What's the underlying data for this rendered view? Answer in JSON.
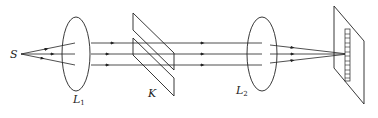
{
  "diagram": {
    "title": "",
    "labels": {
      "source": "S",
      "lens1": "L",
      "lens1_sub": "1",
      "wedge": "K",
      "lens2": "L",
      "lens2_sub": "2"
    },
    "elements": [
      {
        "id": "source",
        "label": "S",
        "type": "point-source"
      },
      {
        "id": "lens1",
        "label": "L1",
        "type": "convex-lens"
      },
      {
        "id": "plates",
        "label": "K",
        "type": "pair-of-glass-plates"
      },
      {
        "id": "lens2",
        "label": "L2",
        "type": "convex-lens"
      },
      {
        "id": "screen",
        "label": "",
        "type": "screen-with-interference-fringes"
      }
    ],
    "colors": {
      "stroke": "#222222",
      "background": "#ffffff"
    }
  }
}
